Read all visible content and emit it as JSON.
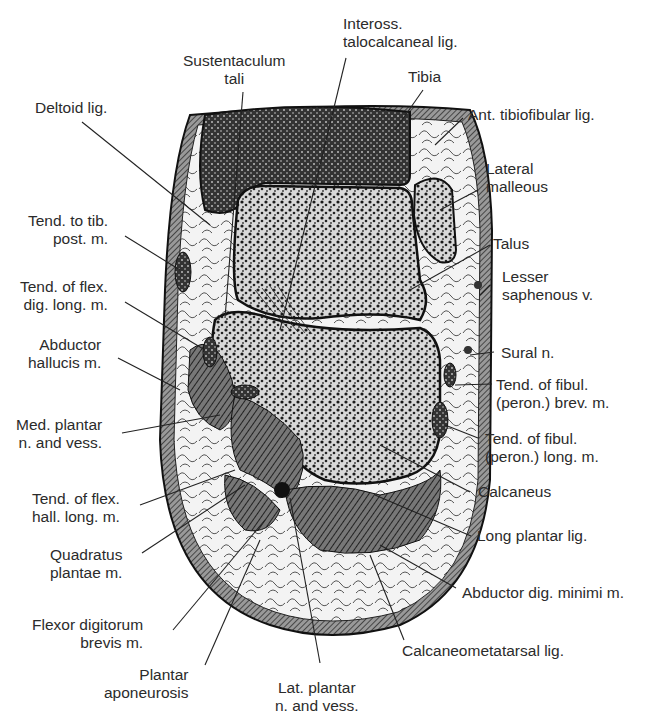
{
  "figure": {
    "labels": {
      "sustentaculum_tali": "Sustentaculum\ntali",
      "inteross_lig": "Inteross.\ntalocalcaneal lig.",
      "tibia": "Tibia",
      "ant_tibiofibular": "Ant. tibiofibular lig.",
      "deltoid": "Deltoid lig.",
      "lateral_malleous": "Lateral\nmalleous",
      "tend_tib_post": "Tend. to tib.\npost. m.",
      "talus": "Talus",
      "tend_flex_dig_long": "Tend. of flex.\ndig. long. m.",
      "lesser_saphenous": "Lesser\nsaphenous v.",
      "abductor_hallucis": "Abductor\nhallucis m.",
      "sural": "Sural n.",
      "med_plantar": "Med. plantar\nn. and vess.",
      "tend_fibul_brev": "Tend. of fibul.\n(peron.) brev. m.",
      "tend_fibul_long": "Tend. of fibul.\n(peron.) long. m.",
      "tend_flex_hall_long": "Tend. of flex.\nhall. long. m.",
      "calcaneus": "Calcaneus",
      "quadratus_plantae": "Quadratus\nplantae m.",
      "long_plantar": "Long plantar lig.",
      "abductor_dig_minimi": "Abductor dig. minimi m.",
      "flexor_dig_brevis": "Flexor digitorum\nbrevis m.",
      "calcaneometatarsal": "Calcaneometatarsal lig.",
      "plantar_aponeurosis": "Plantar\naponeurosis",
      "lat_plantar": "Lat. plantar\nn. and vess."
    },
    "colors": {
      "ink": "#1a1a1a",
      "fat": "#f2f2f2",
      "bone_bg": "#e9e9e9",
      "muscle": "#555555"
    }
  }
}
